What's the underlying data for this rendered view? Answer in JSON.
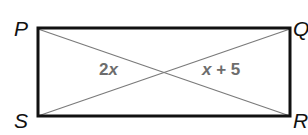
{
  "diagram": {
    "type": "rectangle-with-diagonals",
    "vertices": {
      "top_left": "P",
      "top_right": "Q",
      "bottom_right": "R",
      "bottom_left": "S"
    },
    "segment_labels": {
      "left_segment": {
        "coef": "2",
        "var": "x"
      },
      "right_segment": {
        "var": "x",
        "rest": " + 5"
      }
    },
    "colors": {
      "outline": "#111111",
      "diagonal": "#7a7a7a",
      "label": "#6d6d6d"
    }
  }
}
